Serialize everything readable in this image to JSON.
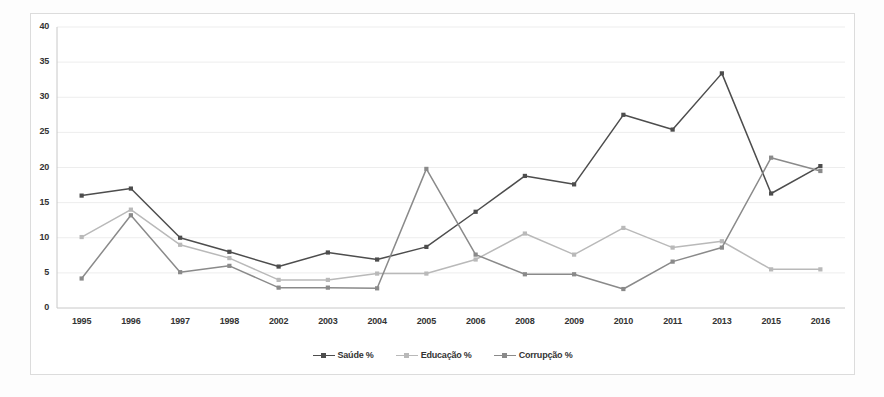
{
  "figure": {
    "background_color": "#fdfdfd",
    "frame_color": "#dcdcdc"
  },
  "chart_data": {
    "type": "line",
    "title": "",
    "subtitle": "",
    "xlabel": "",
    "ylabel": "",
    "categories": [
      "1995",
      "1996",
      "1997",
      "1998",
      "2002",
      "2003",
      "2004",
      "2005",
      "2006",
      "2008",
      "2009",
      "2010",
      "2011",
      "2013",
      "2015",
      "2016"
    ],
    "ylim": [
      0,
      40
    ],
    "yticks": [
      0,
      5,
      10,
      15,
      20,
      25,
      30,
      35,
      40
    ],
    "grid": "horizontal",
    "legend_position": "bottom-center",
    "series": [
      {
        "name": "Saúde %",
        "color": "#4d4d4d",
        "marker": "square",
        "values": [
          16.0,
          17.0,
          10.0,
          8.0,
          5.9,
          7.9,
          6.9,
          8.7,
          13.7,
          18.8,
          17.6,
          27.5,
          25.4,
          33.4,
          16.3,
          20.2
        ]
      },
      {
        "name": "Educação %",
        "color": "#b9b9b9",
        "marker": "square",
        "values": [
          10.1,
          14.0,
          9.0,
          7.1,
          4.0,
          4.0,
          4.9,
          4.9,
          6.9,
          10.6,
          7.6,
          11.4,
          8.6,
          9.5,
          5.5,
          5.5
        ]
      },
      {
        "name": "Corrupção %",
        "color": "#8a8a8a",
        "marker": "square",
        "values": [
          4.2,
          13.2,
          5.1,
          6.0,
          2.9,
          2.9,
          2.8,
          19.8,
          7.6,
          4.8,
          4.8,
          2.7,
          6.6,
          8.6,
          21.4,
          19.5
        ]
      }
    ]
  }
}
